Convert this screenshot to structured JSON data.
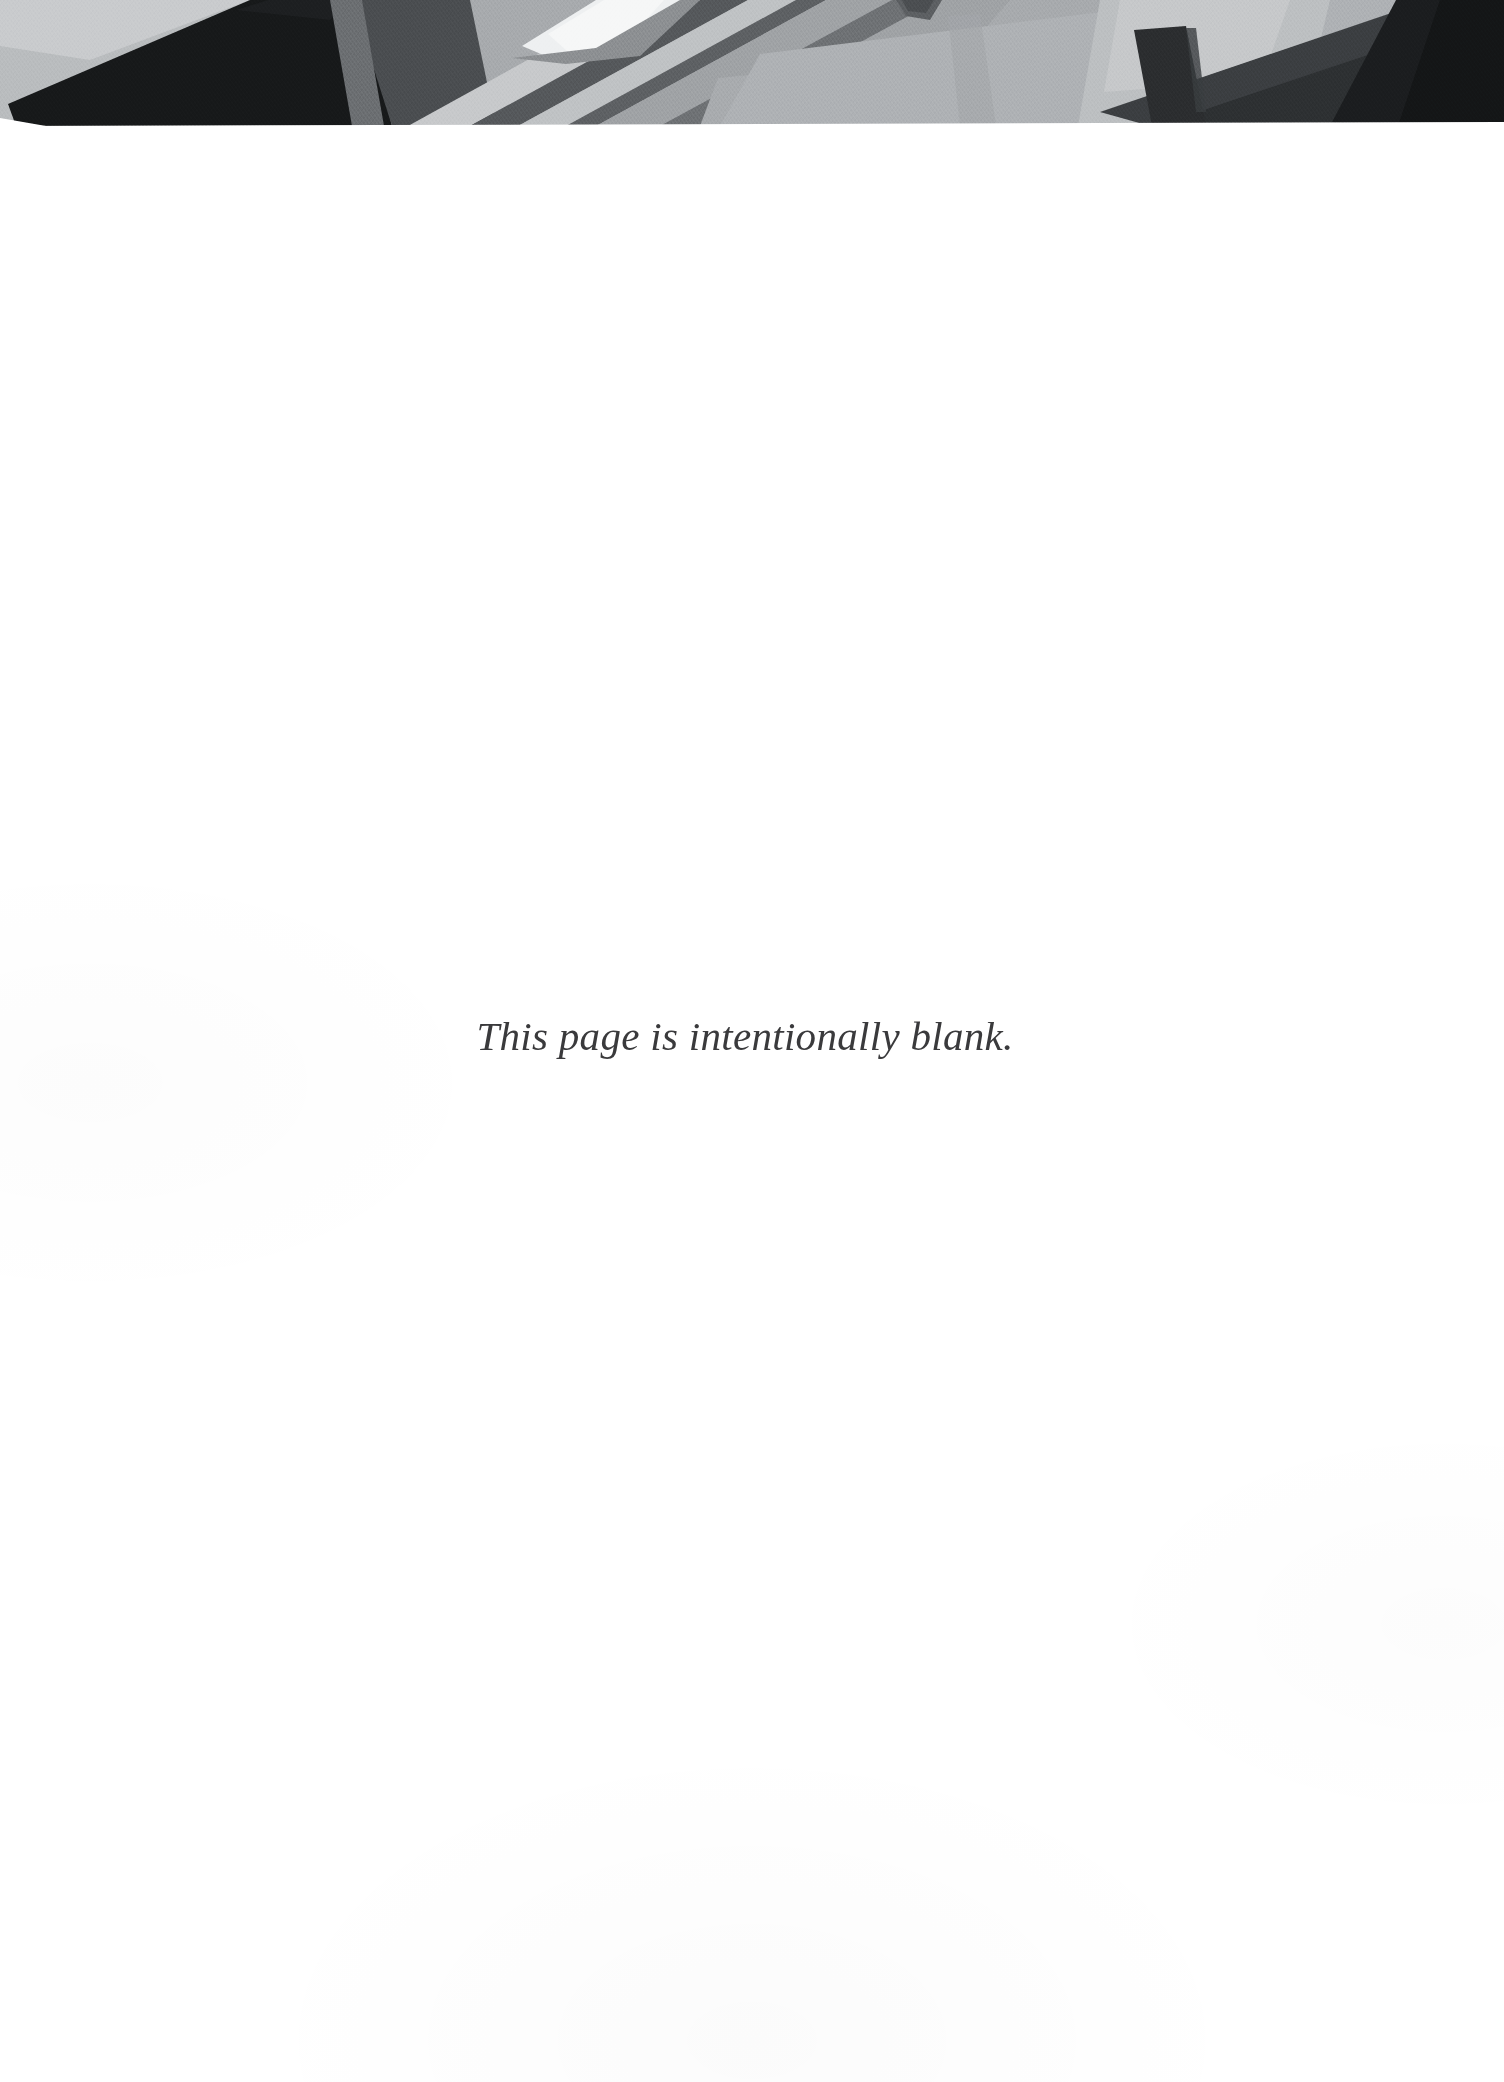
{
  "page": {
    "kind": "scanned-document-page",
    "background_color": "#ffffff",
    "width": 1504,
    "height": 2082
  },
  "header": {
    "name": "decorative-header-band",
    "height_px": 126,
    "palette": {
      "near_black": "#17191a",
      "very_dark": "#232527",
      "dark": "#37393b",
      "dark_mid": "#4a4d50",
      "mid_dark": "#6b6e71",
      "mid": "#8e9194",
      "mid_light": "#a7aaad",
      "light": "#bdc0c2",
      "lighter": "#d3d5d7",
      "highlight": "#eef0f1",
      "white": "#ffffff"
    }
  },
  "notice": {
    "text": "This page is intentionally blank.",
    "color": "#3a3a3c",
    "style": "italic serif",
    "alignment": "center"
  }
}
